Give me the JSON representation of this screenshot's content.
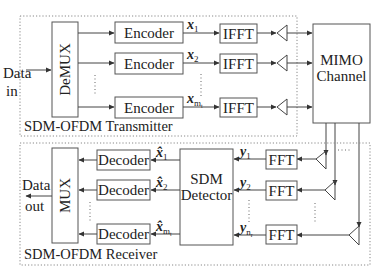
{
  "transmitter": {
    "title": "SDM-OFDM Transmitter",
    "input_label_line1": "Data",
    "input_label_line2": "in",
    "demux_label": "DeMUX",
    "encoders": [
      {
        "label": "Encoder",
        "signal": "x",
        "sub": "1"
      },
      {
        "label": "Encoder",
        "signal": "x",
        "sub": "2"
      },
      {
        "label": "Encoder",
        "signal": "x",
        "sub": "m_t"
      }
    ],
    "ifft_label": "IFFT",
    "ifft_count": 3
  },
  "channel": {
    "label_line1": "MIMO",
    "label_line2": "Channel"
  },
  "receiver": {
    "title": "SDM-OFDM Receiver",
    "output_label_line1": "Data",
    "output_label_line2": "out",
    "mux_label": "MUX",
    "decoders": [
      {
        "label": "Decoder",
        "signal": "x̂",
        "sub": "1"
      },
      {
        "label": "Decoder",
        "signal": "x̂",
        "sub": "2"
      },
      {
        "label": "Decoder",
        "signal": "x̂",
        "sub": "m_t"
      }
    ],
    "detector_line1": "SDM",
    "detector_line2": "Detector",
    "ffts": [
      {
        "label": "FFT",
        "signal": "y",
        "sub": "1"
      },
      {
        "label": "FFT",
        "signal": "y",
        "sub": "2"
      },
      {
        "label": "FFT",
        "signal": "y",
        "sub": "n_r"
      }
    ]
  },
  "colors": {
    "stroke": "#555555",
    "text": "#222222",
    "dotted_border": "#888888",
    "background": "#ffffff"
  }
}
